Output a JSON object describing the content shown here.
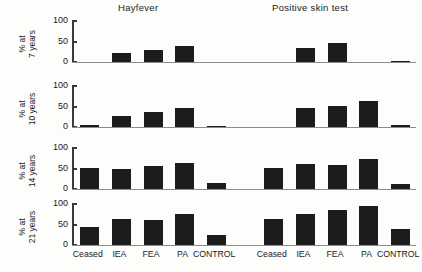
{
  "figure": {
    "group_titles": {
      "left": "Hayfever",
      "right": "Positive skin test"
    },
    "categories": [
      "Ceased",
      "IEA",
      "FEA",
      "PA",
      "CONTROL"
    ],
    "y_ticks": [
      "0",
      "50",
      "100"
    ],
    "panels": [
      {
        "ylabel_line1": "% at",
        "ylabel_line2": "7 years",
        "hayfever": [
          0,
          21,
          28,
          39,
          0
        ],
        "positive_skin_test": [
          0,
          33,
          45,
          0,
          2
        ]
      },
      {
        "ylabel_line1": "% at",
        "ylabel_line2": "10 years",
        "hayfever": [
          4,
          27,
          36,
          45,
          2
        ],
        "positive_skin_test": [
          0,
          45,
          51,
          61,
          4
        ]
      },
      {
        "ylabel_line1": "% at",
        "ylabel_line2": "14 years",
        "hayfever": [
          51,
          48,
          54,
          61,
          14
        ],
        "positive_skin_test": [
          0,
          50,
          59,
          58,
          72,
          11
        ]
      },
      {
        "ylabel_line1": "% at",
        "ylabel_line2": "21 years",
        "hayfever": [
          42,
          63,
          59,
          74,
          24
        ],
        "positive_skin_test": [
          0,
          61,
          74,
          84,
          92,
          39
        ]
      }
    ]
  },
  "chart_data": {
    "type": "bar",
    "title": "",
    "xlabel": "",
    "ylabel": "%",
    "ylim": [
      0,
      100
    ],
    "grid": false,
    "legend": "none",
    "y_tick_values": [
      0,
      50,
      100
    ],
    "categories": [
      "Ceased",
      "IEA",
      "FEA",
      "PA",
      "CONTROL"
    ],
    "panel_groups": [
      "Hayfever",
      "Positive skin test"
    ],
    "panels": [
      {
        "name": "% at 7 years",
        "series": [
          {
            "name": "Hayfever",
            "values": [
              0,
              21,
              28,
              39,
              0
            ]
          },
          {
            "name": "Positive skin test",
            "values": [
              0,
              33,
              45,
              0,
              2
            ]
          }
        ]
      },
      {
        "name": "% at 10 years",
        "series": [
          {
            "name": "Hayfever",
            "values": [
              4,
              27,
              36,
              45,
              2
            ]
          },
          {
            "name": "Positive skin test",
            "values": [
              0,
              45,
              51,
              61,
              4
            ]
          }
        ]
      },
      {
        "name": "% at 14 years",
        "series": [
          {
            "name": "Hayfever",
            "values": [
              51,
              48,
              54,
              61,
              14
            ]
          },
          {
            "name": "Positive skin test",
            "values": [
              50,
              59,
              58,
              72,
              11
            ]
          }
        ]
      },
      {
        "name": "% at 21 years",
        "series": [
          {
            "name": "Hayfever",
            "values": [
              42,
              63,
              59,
              74,
              24
            ]
          },
          {
            "name": "Positive skin test",
            "values": [
              61,
              74,
              84,
              92,
              39
            ]
          }
        ]
      }
    ]
  }
}
